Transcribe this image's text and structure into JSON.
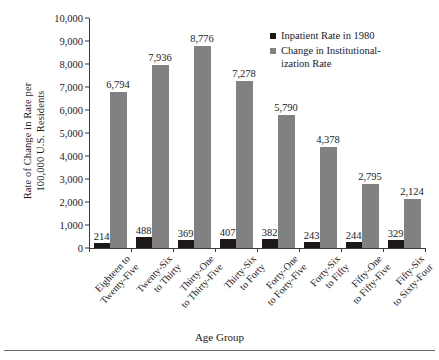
{
  "chart_data": {
    "type": "bar",
    "title": "",
    "xlabel": "Age Group",
    "ylabel": "Rate of Change in Rate per\n100,000 U.S. Residents",
    "ylim": [
      0,
      10000
    ],
    "ytick_values": [
      0,
      1000,
      2000,
      3000,
      4000,
      5000,
      6000,
      7000,
      8000,
      9000,
      10000
    ],
    "ytick_labels": [
      "0",
      "1,000",
      "2,000",
      "3,000",
      "4,000",
      "5,000",
      "6,000",
      "7,000",
      "8,000",
      "9,000",
      "10,000"
    ],
    "grid": false,
    "legend_position": "top-right",
    "categories": [
      "Eighteen to\nTwenty-Five",
      "Twenty-Six\nto Thirty",
      "Thirty-One\nto Thirty-Five",
      "Thirty-Six\nto Forty",
      "Forty-One\nto Forty-Five",
      "Forty-Six\nto Fifty",
      "Fifty-One\nto Fifty-Five",
      "Fifty-Six\nto Sixty-Four"
    ],
    "series": [
      {
        "name": "Inpatient Rate in 1980",
        "color": "#1b1817",
        "values": [
          214,
          488,
          369,
          407,
          382,
          243,
          244,
          329
        ],
        "labels": [
          "214",
          "488",
          "369",
          "407",
          "382",
          "243",
          "244",
          "329"
        ]
      },
      {
        "name": "Change in Institutional-\nization Rate",
        "color": "#818181",
        "values": [
          6794,
          7936,
          8776,
          7278,
          5790,
          4378,
          2795,
          2124
        ],
        "labels": [
          "6,794",
          "7,936",
          "8,776",
          "7,278",
          "5,790",
          "4,378",
          "2,795",
          "2,124"
        ]
      }
    ]
  },
  "legend": {
    "items": [
      {
        "label": "Inpatient Rate in 1980",
        "color": "#1b1817"
      },
      {
        "label": "Change in Institutional-\nization Rate",
        "color": "#818181"
      }
    ]
  },
  "axes": {
    "x_title": "Age Group",
    "y_title": "Rate of Change in Rate per\n100,000 U.S. Residents"
  }
}
